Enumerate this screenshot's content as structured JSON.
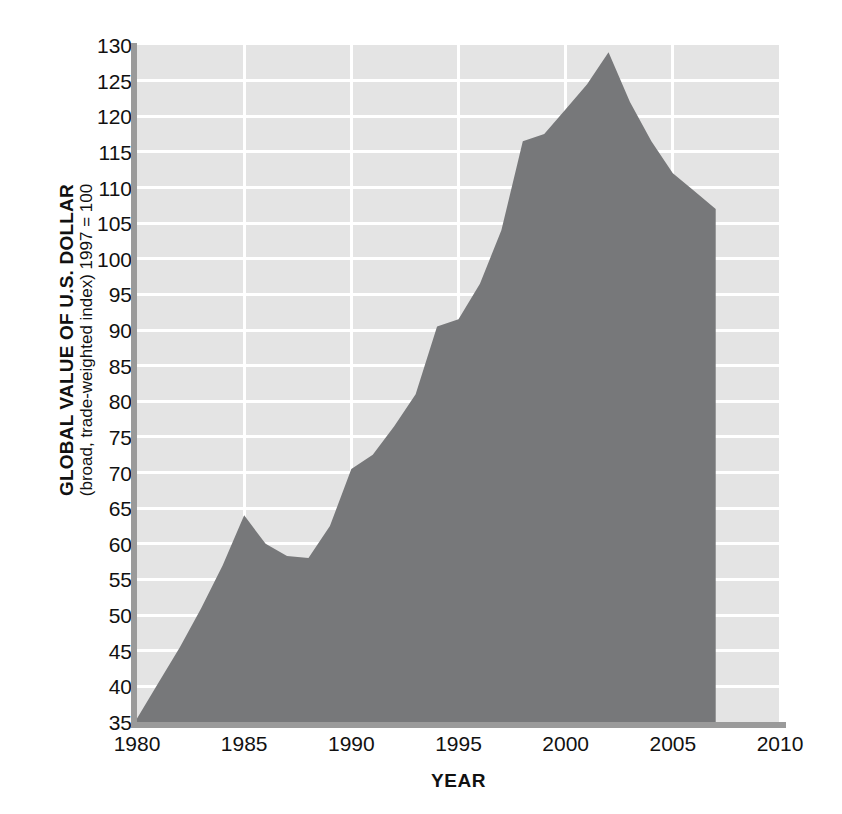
{
  "chart_data": {
    "type": "area",
    "title": "",
    "xlabel": "YEAR",
    "ylabel_main": "GLOBAL VALUE OF U.S. DOLLAR",
    "ylabel_sub": "(broad, trade-weighted index) 1997 = 100",
    "xlim": [
      1980,
      2010
    ],
    "ylim": [
      35,
      130
    ],
    "grid": true,
    "legend": "none",
    "x_ticks": [
      1980,
      1985,
      1990,
      1995,
      2000,
      2005,
      2010
    ],
    "x_tick_labels": [
      "1980",
      "1985",
      "1990",
      "1995",
      "2000",
      "2005",
      "2010"
    ],
    "y_ticks": [
      35,
      40,
      45,
      50,
      55,
      60,
      65,
      70,
      75,
      80,
      85,
      90,
      95,
      100,
      105,
      110,
      115,
      120,
      125,
      130
    ],
    "y_tick_labels": [
      "35",
      "40",
      "45",
      "50",
      "55",
      "60",
      "65",
      "70",
      "75",
      "80",
      "85",
      "90",
      "95",
      "100",
      "105",
      "110",
      "115",
      "120",
      "125",
      "130"
    ],
    "x": [
      1980,
      1981,
      1982,
      1983,
      1984,
      1985,
      1986,
      1987,
      1988,
      1989,
      1990,
      1991,
      1992,
      1993,
      1994,
      1995,
      1996,
      1997,
      1998,
      1999,
      2000,
      2001,
      2002,
      2003,
      2004,
      2005,
      2006,
      2007
    ],
    "values": [
      35.5,
      40.5,
      45.5,
      51.0,
      57.0,
      64.0,
      60.0,
      58.3,
      58.0,
      62.5,
      70.5,
      72.5,
      76.5,
      81.0,
      90.5,
      91.5,
      96.5,
      104.0,
      116.5,
      117.5,
      121.0,
      124.5,
      129.0,
      122.0,
      116.5,
      112.0,
      109.5,
      107.0
    ],
    "series_name": "Global value of U.S. dollar",
    "colors": {
      "area_fill": "#77787a",
      "plot_background": "#e4e4e4",
      "gridline": "#ffffff",
      "axis": "#9a9a9a",
      "text": "#111111",
      "page_background": "#ffffff"
    },
    "annotations": []
  }
}
